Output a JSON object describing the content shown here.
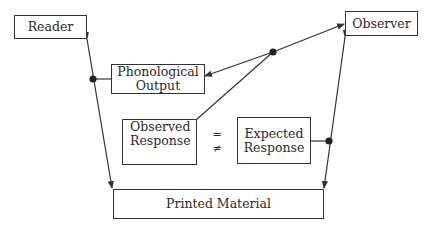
{
  "diagram": {
    "nodes": {
      "reader": {
        "label": "Reader"
      },
      "observer": {
        "label": "Observer"
      },
      "phonological_output": {
        "line1": "Phonological",
        "line2": "Output"
      },
      "observed_response": {
        "line1": "Observed",
        "line2": "Response"
      },
      "expected_response": {
        "line1": "Expected",
        "line2": "Response"
      },
      "printed_material": {
        "label": "Printed Material"
      }
    },
    "comparison": {
      "equal": "=",
      "not_equal": "≠"
    },
    "edges": [
      {
        "from": "printed_material",
        "to": "reader",
        "bidirectional": true
      },
      {
        "from": "junction_left",
        "to": "phonological_output",
        "connector": "dot"
      },
      {
        "from": "junction_center",
        "to": "phonological_output",
        "arrow": true
      },
      {
        "from": "junction_center",
        "to": "observer",
        "arrow": true
      },
      {
        "from": "observed_response",
        "to": "junction_center"
      },
      {
        "from": "printed_material",
        "to": "observer",
        "bidirectional": true
      },
      {
        "from": "expected_response",
        "to": "junction_right",
        "connector": "dot"
      }
    ],
    "colors": {
      "line": "#333333",
      "background": "#ffffff"
    }
  }
}
